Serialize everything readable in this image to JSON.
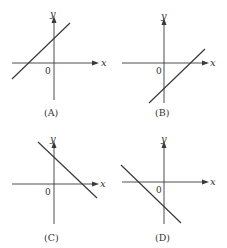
{
  "panels": [
    {
      "id": "A",
      "label": "(A)",
      "x_axis_label": "x",
      "y_axis_label": "y",
      "origin_label": "0",
      "slope": "positive",
      "y_intercept": "positive",
      "x_intercept": "negative"
    },
    {
      "id": "B",
      "label": "(B)",
      "x_axis_label": "x",
      "y_axis_label": "y",
      "origin_label": "0",
      "slope": "positive",
      "y_intercept": "negative",
      "x_intercept": "positive"
    },
    {
      "id": "C",
      "label": "(C)",
      "x_axis_label": "x",
      "y_axis_label": "y",
      "origin_label": "0",
      "slope": "negative",
      "y_intercept": "positive",
      "x_intercept": "positive"
    },
    {
      "id": "D",
      "label": "(D)",
      "x_axis_label": "x",
      "y_axis_label": "y",
      "origin_label": "0",
      "slope": "negative",
      "y_intercept": "negative",
      "x_intercept": "negative"
    }
  ],
  "colors": {
    "ink": "#3a3a3a",
    "background": "#ffffff"
  }
}
